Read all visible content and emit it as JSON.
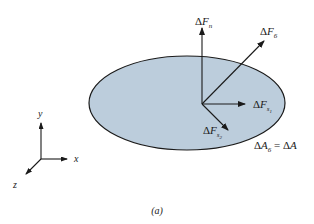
{
  "figure": {
    "caption": "(a)",
    "colors": {
      "area_fill": "#bccddc",
      "area_stroke": "#1a1a1a",
      "line": "#1a1a1a",
      "background": "#ffffff"
    },
    "area": {
      "label_prefix": "Δ",
      "label_main": "A",
      "label_sub": "6",
      "label_eq": " = Δ",
      "label_end": "A",
      "full_label": "ΔA6 = ΔA"
    },
    "forces": [
      {
        "id": "normal",
        "delta": "Δ",
        "main": "F",
        "sub": "n",
        "subsub": "",
        "full_label": "ΔFn"
      },
      {
        "id": "resultant",
        "delta": "Δ",
        "main": "F",
        "sub": "6",
        "subsub": "",
        "full_label": "ΔF6"
      },
      {
        "id": "shear-1",
        "delta": "Δ",
        "main": "F",
        "sub": "s",
        "subsub": "1",
        "full_label": "ΔFs1"
      },
      {
        "id": "shear-2",
        "delta": "Δ",
        "main": "F",
        "sub": "s",
        "subsub": "2",
        "full_label": "ΔFs2"
      }
    ],
    "axes": {
      "x": "x",
      "y": "y",
      "z": "z"
    }
  }
}
